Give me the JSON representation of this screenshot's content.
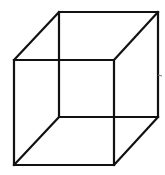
{
  "figure": {
    "type": "necker-cube",
    "stroke_color": "#111111",
    "background": "#ffffff",
    "front_face": {
      "tl": [
        14,
        60
      ],
      "tr": [
        114,
        60
      ],
      "br": [
        114,
        165
      ],
      "bl": [
        14,
        165
      ]
    },
    "back_face": {
      "tl": [
        59,
        12
      ],
      "tr": [
        158,
        12
      ],
      "br": [
        158,
        117
      ],
      "bl": [
        59,
        117
      ]
    },
    "tick_mark": [
      161,
      75
    ]
  }
}
